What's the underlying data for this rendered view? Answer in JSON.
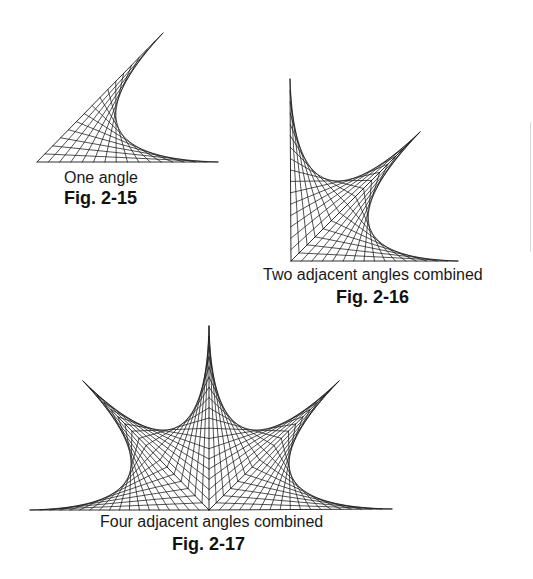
{
  "figures": [
    {
      "id": "fig-2-15",
      "caption": "One angle",
      "label": "Fig. 2-15",
      "vertex": [
        37,
        162
      ],
      "rays": [
        [
          163,
          33
        ],
        [
          218,
          162
        ]
      ],
      "divisions": 16,
      "closed": false
    },
    {
      "id": "fig-2-16",
      "caption": "Two adjacent angles combined",
      "label": "Fig. 2-16",
      "vertex": [
        291,
        261
      ],
      "rays": [
        [
          290,
          79
        ],
        [
          420,
          132
        ],
        [
          458,
          261
        ]
      ],
      "divisions": 16,
      "closed": false
    },
    {
      "id": "fig-2-17",
      "caption": "Four adjacent angles combined",
      "label": "Fig. 2-17",
      "vertex": [
        209,
        510
      ],
      "rays": [
        [
          30,
          510
        ],
        [
          83,
          381
        ],
        [
          209,
          326
        ],
        [
          339,
          381
        ],
        [
          392,
          509
        ]
      ],
      "divisions": 18,
      "closed": false
    }
  ],
  "style": {
    "line_color": "#1a1a1a",
    "background": "#ffffff"
  }
}
